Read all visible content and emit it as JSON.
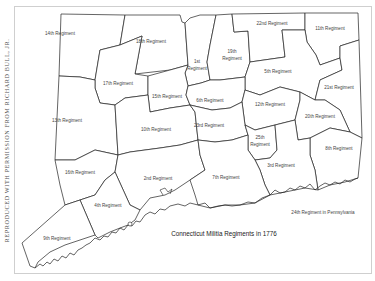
{
  "credit": "REPRODUCED WITH PERMISSION FROM RICHARD BULL, JR.",
  "map": {
    "title": "Connecticut Militia Regiments in 1776",
    "note": "24th Regiment in Pennsylvania",
    "regiments": [
      {
        "id": "r14",
        "label": "14th Regiment",
        "x": 60,
        "y": 35
      },
      {
        "id": "r18",
        "label": "18th Regiment",
        "x": 151,
        "y": 43
      },
      {
        "id": "r1a",
        "label": "1st",
        "x": 197,
        "y": 63
      },
      {
        "id": "r1b",
        "label": "Regiment",
        "x": 197,
        "y": 70
      },
      {
        "id": "r19a",
        "label": "19th",
        "x": 232,
        "y": 53
      },
      {
        "id": "r19b",
        "label": "Regiment",
        "x": 232,
        "y": 60
      },
      {
        "id": "r22",
        "label": "22nd Regiment",
        "x": 272,
        "y": 25
      },
      {
        "id": "r11",
        "label": "11th Regiment",
        "x": 330,
        "y": 30
      },
      {
        "id": "r5",
        "label": "5th Regiment",
        "x": 278,
        "y": 73
      },
      {
        "id": "r21",
        "label": "21st Regiment",
        "x": 339,
        "y": 89
      },
      {
        "id": "r17",
        "label": "17th Regiment",
        "x": 118,
        "y": 85
      },
      {
        "id": "r15",
        "label": "15th Regiment",
        "x": 167,
        "y": 98
      },
      {
        "id": "r6",
        "label": "6th Regiment",
        "x": 210,
        "y": 102
      },
      {
        "id": "r12",
        "label": "12th Regiment",
        "x": 270,
        "y": 106
      },
      {
        "id": "r20",
        "label": "20th Regiment",
        "x": 320,
        "y": 118
      },
      {
        "id": "r13",
        "label": "13th Regiment",
        "x": 67,
        "y": 122
      },
      {
        "id": "r10",
        "label": "10th Regiment",
        "x": 156,
        "y": 131
      },
      {
        "id": "r23",
        "label": "23rd Regiment",
        "x": 209,
        "y": 127
      },
      {
        "id": "r25a",
        "label": "25th",
        "x": 260,
        "y": 139
      },
      {
        "id": "r25b",
        "label": "Regiment",
        "x": 260,
        "y": 146
      },
      {
        "id": "r8",
        "label": "8th Regiment",
        "x": 339,
        "y": 150
      },
      {
        "id": "r3",
        "label": "3rd Regiment",
        "x": 281,
        "y": 167
      },
      {
        "id": "r16",
        "label": "16th Regiment",
        "x": 80,
        "y": 174
      },
      {
        "id": "r2",
        "label": "2nd Regiment",
        "x": 158,
        "y": 180
      },
      {
        "id": "r7",
        "label": "7th Regiment",
        "x": 226,
        "y": 179
      },
      {
        "id": "r4",
        "label": "4th Regiment",
        "x": 108,
        "y": 207
      },
      {
        "id": "r9",
        "label": "9th Regiment",
        "x": 57,
        "y": 240
      }
    ]
  }
}
